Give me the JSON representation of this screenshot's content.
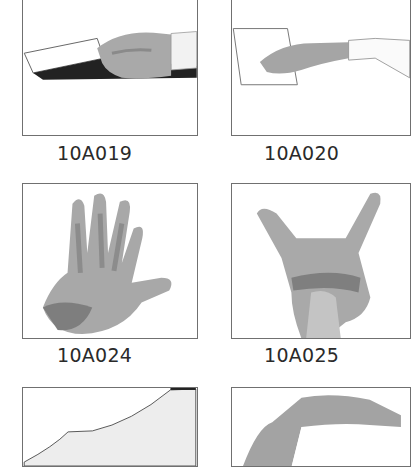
{
  "catalog": {
    "items": [
      {
        "code": "10A019",
        "subject": "hand holding card"
      },
      {
        "code": "10A020",
        "subject": "hand reaching to paper"
      },
      {
        "code": "10A024",
        "subject": "open hand spread fingers"
      },
      {
        "code": "10A025",
        "subject": "hand pointing gesture"
      },
      {
        "code": "",
        "subject": "forearm edge partial"
      },
      {
        "code": "",
        "subject": "bent arm partial"
      }
    ]
  }
}
